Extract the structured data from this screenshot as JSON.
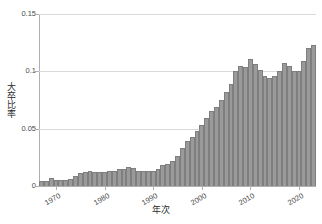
{
  "chart_data": {
    "type": "bar",
    "title": "",
    "xlabel": "年次",
    "ylabel": "大卒比率",
    "ylim": [
      0,
      0.15
    ],
    "xlim": [
      1967,
      2023
    ],
    "grid": true,
    "legend": false,
    "bar_color": "#9a9a9a",
    "bar_edge_color": "#7e7e7e",
    "grid_color": "#d9d9d9",
    "axis_color": "#b0b0b0",
    "ytick_labels": [
      "0",
      "0.05",
      "0.1",
      "0.15"
    ],
    "ytick_values": [
      0,
      0.05,
      0.1,
      0.15
    ],
    "xtick_labels": [
      "1970",
      "1980",
      "1990",
      "2000",
      "2010",
      "2020"
    ],
    "xtick_values": [
      1970,
      1980,
      1990,
      2000,
      2010,
      2020
    ],
    "categories": [
      1967,
      1968,
      1969,
      1970,
      1971,
      1972,
      1973,
      1974,
      1975,
      1976,
      1977,
      1978,
      1979,
      1980,
      1981,
      1982,
      1983,
      1984,
      1985,
      1986,
      1987,
      1988,
      1989,
      1990,
      1991,
      1992,
      1993,
      1994,
      1995,
      1996,
      1997,
      1998,
      1999,
      2000,
      2001,
      2002,
      2003,
      2004,
      2005,
      2006,
      2007,
      2008,
      2009,
      2010,
      2011,
      2012,
      2013,
      2014,
      2015,
      2016,
      2017,
      2018,
      2019,
      2020,
      2021,
      2022,
      2023
    ],
    "values": [
      0.004,
      0.004,
      0.007,
      0.005,
      0.005,
      0.005,
      0.006,
      0.009,
      0.011,
      0.012,
      0.013,
      0.012,
      0.012,
      0.012,
      0.013,
      0.013,
      0.015,
      0.015,
      0.017,
      0.016,
      0.013,
      0.013,
      0.013,
      0.013,
      0.015,
      0.018,
      0.019,
      0.022,
      0.026,
      0.033,
      0.039,
      0.043,
      0.048,
      0.053,
      0.059,
      0.065,
      0.069,
      0.075,
      0.082,
      0.089,
      0.1,
      0.105,
      0.104,
      0.111,
      0.106,
      0.101,
      0.096,
      0.094,
      0.096,
      0.1,
      0.107,
      0.105,
      0.1,
      0.1,
      0.109,
      0.12,
      0.123
    ],
    "caption": ""
  }
}
